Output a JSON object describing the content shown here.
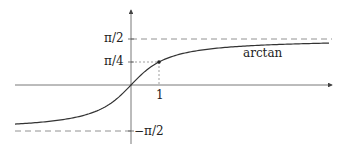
{
  "diagram": {
    "function_label": "arctan",
    "y_labels": {
      "pi_over_2": "π/2",
      "pi_over_4": "π/4",
      "neg_pi_over_2": "−π/2"
    },
    "x_labels": {
      "one": "1"
    },
    "colors": {
      "curve": "#333333",
      "axes": "#555555",
      "dashed": "#777777",
      "text": "#222222"
    }
  }
}
